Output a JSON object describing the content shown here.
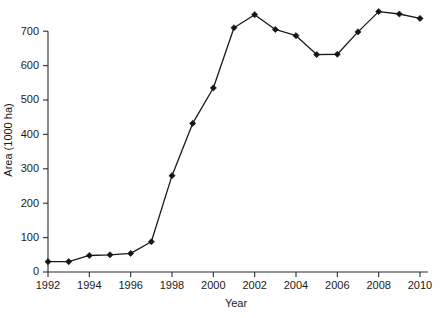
{
  "chart_data": {
    "type": "line",
    "title": "",
    "subtitle": "",
    "xlabel": "Year",
    "ylabel": "Area (1000 ha)",
    "xlim": [
      1992,
      2010
    ],
    "ylim": [
      0,
      780
    ],
    "grid": false,
    "legend": false,
    "legend_position": "none",
    "marker": "diamond",
    "line_color": "#1a1a1a",
    "marker_color": "#151515",
    "background_color": "#ffffff",
    "x_tick_labels": [
      "1992",
      "1994",
      "1996",
      "1998",
      "2000",
      "2002",
      "2004",
      "2006",
      "2008",
      "2010"
    ],
    "x_tick_values": [
      1992,
      1994,
      1996,
      1998,
      2000,
      2002,
      2004,
      2006,
      2008,
      2010
    ],
    "y_tick_labels": [
      "0",
      "100",
      "200",
      "300",
      "400",
      "500",
      "600",
      "700"
    ],
    "y_tick_values": [
      0,
      100,
      200,
      300,
      400,
      500,
      600,
      700
    ],
    "x": [
      1992,
      1993,
      1994,
      1995,
      1996,
      1997,
      1998,
      1999,
      2000,
      2001,
      2002,
      2003,
      2004,
      2005,
      2006,
      2007,
      2008,
      2009,
      2010
    ],
    "values": [
      30,
      30,
      48,
      50,
      54,
      88,
      280,
      432,
      535,
      710,
      748,
      705,
      687,
      632,
      633,
      698,
      757,
      750,
      737
    ],
    "series": [
      {
        "name": "Area",
        "values": [
          30,
          30,
          48,
          50,
          54,
          88,
          280,
          432,
          535,
          710,
          748,
          705,
          687,
          632,
          633,
          698,
          757,
          750,
          737
        ]
      }
    ]
  }
}
